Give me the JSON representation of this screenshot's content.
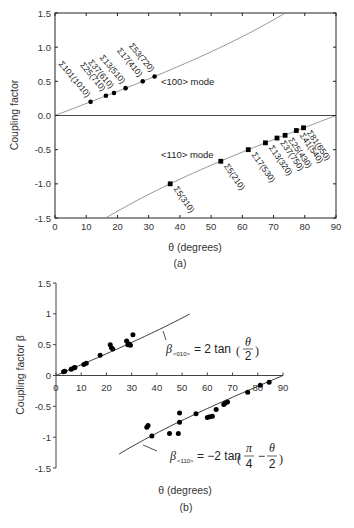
{
  "chart_data": [
    {
      "panel": "(a)",
      "type": "line",
      "title": "",
      "xlabel": "θ (degrees)",
      "ylabel": "Coupling factor",
      "xlim": [
        0,
        90
      ],
      "ylim": [
        -1.5,
        1.5
      ],
      "xticks": [
        "0",
        "10",
        "20",
        "30",
        "40",
        "50",
        "60",
        "70",
        "80",
        "90"
      ],
      "yticks": [
        "1.5",
        "1.0",
        "0.5",
        "0.0",
        "-0.5",
        "-1.0",
        "-1.5"
      ],
      "grid": false,
      "zero_line": true,
      "series": [
        {
          "name": "<100> mode",
          "marker": "circle",
          "curve": "2tan(θ/2)",
          "points": [
            {
              "label": "Σ101(1010)",
              "theta": 11.4,
              "value": 0.2
            },
            {
              "label": "Σ25(710)",
              "theta": 16.3,
              "value": 0.29
            },
            {
              "label": "Σ37(610)",
              "theta": 18.9,
              "value": 0.33
            },
            {
              "label": "Σ13(510)",
              "theta": 22.6,
              "value": 0.4
            },
            {
              "label": "Σ17(410)",
              "theta": 28.1,
              "value": 0.5
            },
            {
              "label": "Σ53(720)",
              "theta": 31.9,
              "value": 0.57
            }
          ]
        },
        {
          "name": "<110> mode",
          "marker": "square",
          "curve": "-2tan(π/4 - θ/2)",
          "points": [
            {
              "label": "Σ5(310)",
              "theta": 36.9,
              "value": -1.0
            },
            {
              "label": "Σ5(210)",
              "theta": 53.1,
              "value": -0.67
            },
            {
              "label": "Σ17(530)",
              "theta": 61.9,
              "value": -0.5
            },
            {
              "label": "Σ13(320)",
              "theta": 67.4,
              "value": -0.4
            },
            {
              "label": "Σ37(750)",
              "theta": 71.1,
              "value": -0.33
            },
            {
              "label": "Σ25(430)",
              "theta": 73.7,
              "value": -0.29
            },
            {
              "label": "Σ41(540)",
              "theta": 77.3,
              "value": -0.22
            },
            {
              "label": "Σ81(650)",
              "theta": 79.6,
              "value": -0.18
            }
          ]
        }
      ],
      "annotations": [
        "<100> mode",
        "<110> mode"
      ],
      "caption": "(a)"
    },
    {
      "panel": "(b)",
      "type": "scatter",
      "title": "",
      "xlabel": "θ (degrees)",
      "ylabel": "Coupling factor β",
      "xlim": [
        0,
        90
      ],
      "ylim": [
        -1.5,
        1.5
      ],
      "xticks": [
        "0",
        "10",
        "20",
        "30",
        "40",
        "50",
        "60",
        "70",
        "80",
        "90"
      ],
      "yticks": [
        "1.5",
        "1",
        "0.5",
        "0",
        "-0.5",
        "-1",
        "-1.5"
      ],
      "grid": false,
      "series": [
        {
          "name": "β<010>",
          "fit": "β<010> = 2tan(θ/2)",
          "x": [
            3,
            3.5,
            6,
            7,
            7.5,
            11,
            12,
            17.5,
            21.5,
            22,
            22.5,
            28,
            28.5,
            29,
            29.5,
            30.5
          ],
          "y": [
            0.06,
            0.07,
            0.1,
            0.12,
            0.13,
            0.18,
            0.2,
            0.33,
            0.5,
            0.45,
            0.43,
            0.56,
            0.5,
            0.51,
            0.49,
            0.66
          ]
        },
        {
          "name": "β<110>",
          "fit": "β<110> = -2tan(π/4 - θ/2)",
          "x": [
            36,
            36.5,
            38,
            45,
            48.5,
            49,
            49,
            55.5,
            60,
            61,
            62,
            63.5,
            66.5,
            67,
            68,
            76,
            81,
            84.5
          ],
          "y": [
            -0.84,
            -0.81,
            -0.98,
            -0.94,
            -0.94,
            -0.61,
            -0.76,
            -0.62,
            -0.68,
            -0.67,
            -0.66,
            -0.55,
            -0.47,
            -0.45,
            -0.43,
            -0.27,
            -0.16,
            -0.11
          ]
        }
      ],
      "annotations": [
        "β<010> = 2 tan(θ/2)",
        "β<110> = −2 tan(π/4 − θ/2)"
      ],
      "caption": "(b)"
    }
  ],
  "panel_a": {
    "ylabel": "Coupling factor",
    "xlabel": "θ (degrees)",
    "caption": "(a)",
    "mode100": "<100> mode",
    "mode110": "<110> mode"
  },
  "panel_b": {
    "ylabel": "Coupling factor β",
    "xlabel": "θ (degrees)",
    "caption": "(b)",
    "formula1": {
      "beta": "β",
      "sub": "<010>",
      "rhs": "= 2 tan",
      "num": "θ",
      "den": "2"
    },
    "formula2": {
      "beta": "β",
      "sub": "<110>",
      "rhs": "= −2 tan",
      "num1": "π",
      "den1": "4",
      "minus": "−",
      "num2": "θ",
      "den2": "2"
    }
  }
}
